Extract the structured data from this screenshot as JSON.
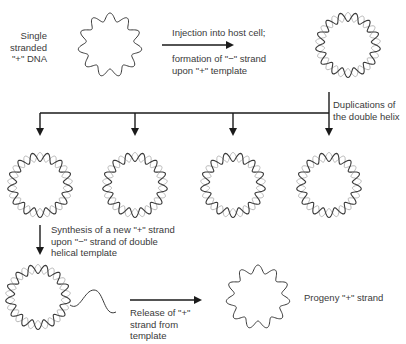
{
  "labels": {
    "single_stranded": [
      "Single",
      "stranded",
      "\"+\" DNA"
    ],
    "injection_top": "Injection into host cell;",
    "injection_bottom": [
      "formation of \"−\" strand",
      "upon \"+\" template"
    ],
    "duplications": [
      "Duplications of",
      "the double helix"
    ],
    "synthesis": [
      "Synthesis of a new \"+\" strand",
      "upon \"−\" strand of double",
      "helical template"
    ],
    "release": [
      "Release of \"+\"",
      "strand from",
      "template"
    ],
    "progeny": "Progeny \"+\" strand"
  },
  "colors": {
    "dark_strand": "#3a3a3a",
    "light_strand": "#b8b8b8",
    "arrow": "#1a1a1a"
  },
  "nodes": [
    {
      "id": "ss-plus-dna",
      "type": "single-strand",
      "cx": 110,
      "cy": 45
    },
    {
      "id": "ds-after-injection",
      "type": "double-helix",
      "cx": 348,
      "cy": 45
    },
    {
      "id": "ds-copy-1",
      "type": "double-helix",
      "cx": 40,
      "cy": 185
    },
    {
      "id": "ds-copy-2",
      "type": "double-helix",
      "cx": 135,
      "cy": 185
    },
    {
      "id": "ds-copy-3",
      "type": "double-helix",
      "cx": 233,
      "cy": 185
    },
    {
      "id": "ds-copy-4",
      "type": "double-helix",
      "cx": 329,
      "cy": 185
    },
    {
      "id": "ds-synthesizing",
      "type": "double-helix-with-tail",
      "cx": 38,
      "cy": 297
    },
    {
      "id": "progeny-plus-strand",
      "type": "single-strand",
      "cx": 258,
      "cy": 297
    }
  ]
}
